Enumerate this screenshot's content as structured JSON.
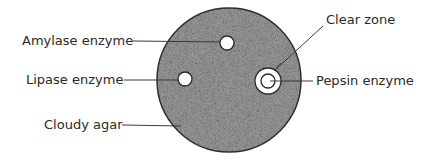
{
  "diagram": {
    "type": "agar plate enzyme test",
    "plate": {
      "cx": 229,
      "cy": 80,
      "r": 72,
      "fill": "#8a8a8a",
      "stroke": "#2e2e2e"
    },
    "wells": [
      {
        "id": "amylase",
        "cx": 227,
        "cy": 43,
        "r": 7,
        "clear_zone": false
      },
      {
        "id": "lipase",
        "cx": 185,
        "cy": 79,
        "r": 7,
        "clear_zone": false
      },
      {
        "id": "pepsin",
        "cx": 268,
        "cy": 81,
        "r": 7,
        "clear_zone": true,
        "clear_zone_r": 13
      }
    ],
    "labels": {
      "amylase": "Amylase enzyme",
      "lipase": "Lipase enzyme",
      "cloudy_agar": "Cloudy agar",
      "clear_zone": "Clear zone",
      "pepsin": "Pepsin enzyme"
    }
  }
}
